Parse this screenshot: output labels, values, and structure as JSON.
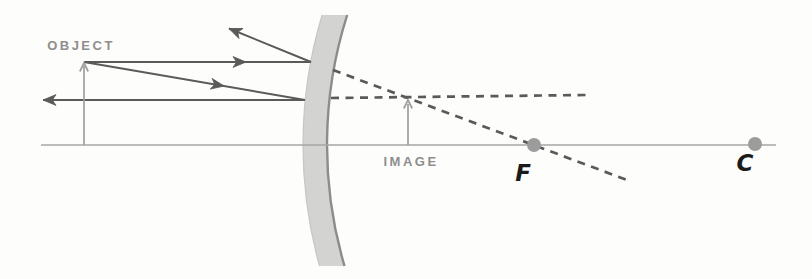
{
  "labels": {
    "object": "OBJECT",
    "image": "IMAGE",
    "focal": "F",
    "center": "C"
  },
  "colors": {
    "background": "#fdfdfb",
    "ray": "#5a5a5a",
    "axis": "#a6a6a6",
    "gray_arrow": "#9e9e9e",
    "gray_label": "#8e8e8e",
    "black_label": "#1b1b1b",
    "mirror_fill": "#d3d3d1",
    "mirror_edge": "#8c8c8c",
    "mirror_outer_edge": "#c6c6c4",
    "point": "#9c9c9c"
  },
  "geometry": {
    "canvas": {
      "width": 812,
      "height": 279
    },
    "axis": {
      "x1": 41,
      "x2": 776,
      "y": 145
    },
    "mirror": {
      "cx": 755,
      "cy": 145,
      "inner_r": 428,
      "outer_r": 452,
      "top_y": 15,
      "bottom_y": 266
    },
    "object_arrow": {
      "x": 84,
      "base_y": 145,
      "tip_y": 64
    },
    "image_arrow": {
      "x": 408,
      "base_y": 145,
      "tip_y": 102
    },
    "points": [
      {
        "name": "focal-point-dot",
        "x": 534,
        "y": 145,
        "r": 7
      },
      {
        "name": "center-point-dot",
        "x": 755,
        "y": 144,
        "r": 7
      }
    ],
    "solid_rays": [
      {
        "name": "incident-ray-parallel",
        "x1": 84,
        "y1": 62,
        "x2": 311,
        "y2": 62
      },
      {
        "name": "reflected-ray-upper",
        "x1": 311,
        "y1": 62,
        "x2": 229,
        "y2": 28.5
      },
      {
        "name": "incident-ray-toward-focus",
        "x1": 84,
        "y1": 62,
        "x2": 305,
        "y2": 100
      },
      {
        "name": "reflected-ray-lower",
        "x1": 305,
        "y1": 100,
        "x2": 43,
        "y2": 100
      }
    ],
    "dashed_rays": [
      {
        "name": "virtual-extension-through-focus",
        "x1": 333,
        "y1": 70,
        "x2": 627,
        "y2": 180
      },
      {
        "name": "virtual-extension-horizontal",
        "x1": 331,
        "y1": 98,
        "x2": 586,
        "y2": 95
      }
    ],
    "arrowheads": [
      {
        "kind": "ray",
        "x": 246,
        "y": 62,
        "angle": 0,
        "name": "arrowhead-incident-parallel"
      },
      {
        "kind": "ray",
        "x": 229,
        "y": 28.5,
        "angle": -157.5,
        "name": "arrowhead-reflected-upper"
      },
      {
        "kind": "ray",
        "x": 224,
        "y": 86,
        "angle": 9.8,
        "name": "arrowhead-incident-toward-focus"
      },
      {
        "kind": "ray",
        "x": 43,
        "y": 100,
        "angle": 180,
        "name": "arrowhead-reflected-lower"
      },
      {
        "kind": "gray",
        "x": 84,
        "y": 63,
        "angle": -90,
        "name": "arrowhead-object-tip"
      },
      {
        "kind": "gray",
        "x": 408,
        "y": 100,
        "angle": -90,
        "name": "arrowhead-image-tip"
      }
    ],
    "label_positions": {
      "object": {
        "x": 81,
        "y": 50
      },
      "image": {
        "x": 411,
        "y": 166
      },
      "focal": {
        "x": 523,
        "y": 181
      },
      "center": {
        "x": 745,
        "y": 171
      }
    }
  }
}
